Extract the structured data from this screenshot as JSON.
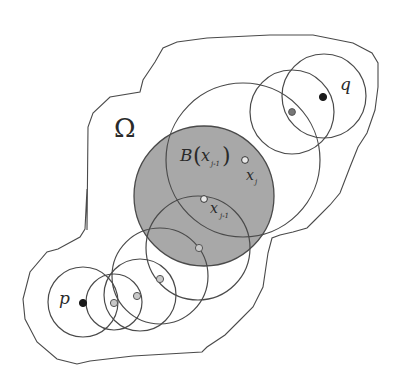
{
  "diagram": {
    "colors": {
      "stroke": "#4a4a4a",
      "shaded_ball": "#a8a8a8",
      "endpoint_dot": "#1a1a1a",
      "chain_dot_fill": "#c8c8c8",
      "q_neighbor_dot": "#777777",
      "background": "#ffffff"
    },
    "labels": {
      "domain": "Ω",
      "start_point": "p",
      "end_point": "q",
      "ball_B": "B",
      "ball_arg": "x",
      "ball_sub": "j-1",
      "point_xj": "x",
      "point_xj_sub": "j",
      "point_xj1": "x",
      "point_xj1_sub": "j-1"
    },
    "domain_boundary": [
      [
        87,
        230
      ],
      [
        88,
        127
      ],
      [
        93,
        113
      ],
      [
        110,
        97
      ],
      [
        140,
        92
      ],
      [
        143,
        80
      ],
      [
        155,
        62
      ],
      [
        163,
        48
      ],
      [
        177,
        42
      ],
      [
        207,
        38
      ],
      [
        270,
        35
      ],
      [
        313,
        35
      ],
      [
        353,
        43
      ],
      [
        372,
        53
      ],
      [
        378,
        63
      ],
      [
        378,
        87
      ],
      [
        375,
        110
      ],
      [
        367,
        133
      ],
      [
        358,
        147
      ],
      [
        350,
        167
      ],
      [
        340,
        193
      ],
      [
        330,
        205
      ],
      [
        315,
        220
      ],
      [
        307,
        228
      ],
      [
        293,
        232
      ],
      [
        280,
        235
      ],
      [
        272,
        238
      ],
      [
        268,
        253
      ],
      [
        263,
        287
      ],
      [
        253,
        307
      ],
      [
        240,
        320
      ],
      [
        225,
        335
      ],
      [
        207,
        347
      ],
      [
        202,
        352
      ],
      [
        133,
        356
      ],
      [
        90,
        361
      ],
      [
        77,
        364
      ],
      [
        57,
        359
      ],
      [
        37,
        342
      ],
      [
        25,
        319
      ],
      [
        23,
        299
      ],
      [
        30,
        272
      ],
      [
        47,
        252
      ],
      [
        58,
        249
      ],
      [
        80,
        237
      ],
      [
        85,
        229
      ],
      [
        87,
        189
      ]
    ],
    "shaded_ball": {
      "cx": 204,
      "cy": 196,
      "r": 70
    },
    "circles": [
      {
        "name": "ball-p",
        "cx": 83,
        "cy": 302,
        "r": 35
      },
      {
        "name": "ball-2",
        "cx": 114,
        "cy": 302,
        "r": 28
      },
      {
        "name": "ball-3",
        "cx": 140,
        "cy": 295,
        "r": 36
      },
      {
        "name": "ball-4",
        "cx": 160,
        "cy": 276,
        "r": 48
      },
      {
        "name": "ball-5",
        "cx": 198,
        "cy": 248,
        "r": 52
      },
      {
        "name": "ball-xj",
        "cx": 243,
        "cy": 160,
        "r": 77
      },
      {
        "name": "ball-q-neighbor",
        "cx": 292,
        "cy": 112,
        "r": 42
      },
      {
        "name": "ball-q",
        "cx": 324,
        "cy": 96,
        "r": 42
      }
    ],
    "points": [
      {
        "name": "p",
        "x": 83,
        "y": 303,
        "kind": "endpoint"
      },
      {
        "name": "chain-1",
        "x": 114,
        "y": 303,
        "kind": "chain"
      },
      {
        "name": "chain-2",
        "x": 137,
        "y": 296,
        "kind": "chain"
      },
      {
        "name": "chain-3",
        "x": 160,
        "y": 279,
        "kind": "chain"
      },
      {
        "name": "chain-4",
        "x": 199,
        "y": 248,
        "kind": "chain"
      },
      {
        "name": "x_j-1",
        "x": 204,
        "y": 199,
        "kind": "open"
      },
      {
        "name": "x_j",
        "x": 245,
        "y": 160,
        "kind": "open"
      },
      {
        "name": "q-neighbor",
        "x": 292,
        "y": 112,
        "kind": "gray"
      },
      {
        "name": "q",
        "x": 323,
        "y": 97,
        "kind": "endpoint"
      }
    ]
  }
}
